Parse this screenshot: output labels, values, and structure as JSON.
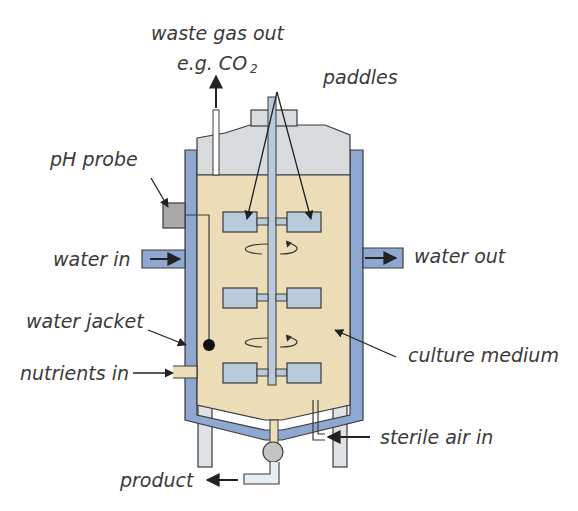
{
  "diagram": {
    "colors": {
      "culture_medium": "#ecdcb8",
      "headspace": "#d8dbde",
      "water_jacket": "#8ea8d2",
      "paddle": "#b9cbdb",
      "shaft": "#b9cbdb",
      "probe": "#a9a9a9",
      "legs": "#dfe3e6",
      "outline": "#3a3a3a",
      "label_text": "#3a3a3a"
    },
    "labels": {
      "waste_gas_line1": "waste gas out",
      "waste_gas_line2": "e.g. CO",
      "waste_gas_subscript": "2",
      "paddles": "paddles",
      "ph_probe": "pH probe",
      "water_in": "water in",
      "water_out": "water out",
      "water_jacket": "water jacket",
      "nutrients_in": "nutrients in",
      "culture_medium": "culture medium",
      "sterile_air_in": "sterile air in",
      "product": "product"
    }
  }
}
